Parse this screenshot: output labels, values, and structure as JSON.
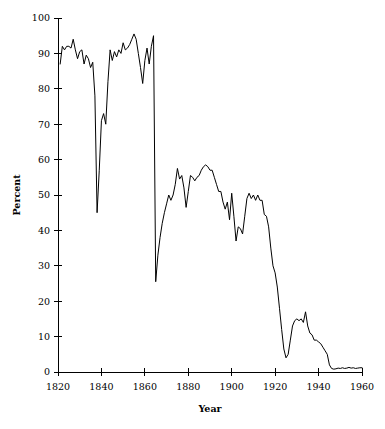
{
  "chart_data": {
    "type": "line",
    "title": "",
    "subtitle": "",
    "xlabel": "Year",
    "ylabel": "Percent",
    "xlim": [
      1820,
      1960
    ],
    "ylim": [
      0,
      100
    ],
    "xticks": [
      1820,
      1840,
      1860,
      1880,
      1900,
      1920,
      1940,
      1960
    ],
    "yticks": [
      0,
      10,
      20,
      30,
      40,
      50,
      60,
      70,
      80,
      90,
      100
    ],
    "xtick_labels": [
      "1820",
      "1840",
      "1860",
      "1880",
      "1900",
      "1920",
      "1940",
      "1960"
    ],
    "ytick_labels": [
      "0",
      "10",
      "20",
      "30",
      "40",
      "50",
      "60",
      "70",
      "80",
      "90",
      "100"
    ],
    "grid": false,
    "legend": false,
    "legend_position": "none",
    "line_color": "#000000",
    "background_color": "#ffffff",
    "series": [
      {
        "name": "Percent",
        "x": [
          1821,
          1822,
          1823,
          1824,
          1825,
          1826,
          1827,
          1828,
          1829,
          1830,
          1831,
          1832,
          1833,
          1834,
          1835,
          1836,
          1837,
          1838,
          1839,
          1840,
          1841,
          1842,
          1843,
          1844,
          1845,
          1846,
          1847,
          1848,
          1849,
          1850,
          1851,
          1852,
          1853,
          1854,
          1855,
          1856,
          1857,
          1858,
          1859,
          1860,
          1861,
          1862,
          1863,
          1864,
          1865,
          1866,
          1867,
          1868,
          1869,
          1870,
          1871,
          1872,
          1873,
          1874,
          1875,
          1876,
          1877,
          1878,
          1879,
          1880,
          1881,
          1882,
          1883,
          1884,
          1885,
          1886,
          1887,
          1888,
          1889,
          1890,
          1891,
          1892,
          1893,
          1894,
          1895,
          1896,
          1897,
          1898,
          1899,
          1900,
          1901,
          1902,
          1903,
          1904,
          1905,
          1906,
          1907,
          1908,
          1909,
          1910,
          1911,
          1912,
          1913,
          1914,
          1915,
          1916,
          1917,
          1918,
          1919,
          1920,
          1921,
          1922,
          1923,
          1924,
          1925,
          1926,
          1927,
          1928,
          1929,
          1930,
          1931,
          1932,
          1933,
          1934,
          1935,
          1936,
          1937,
          1938,
          1939,
          1940,
          1941,
          1942,
          1943,
          1944,
          1945,
          1946,
          1947,
          1948,
          1949,
          1950,
          1951,
          1952,
          1953,
          1954,
          1955,
          1956,
          1957,
          1958,
          1959,
          1960
        ],
        "values": [
          87,
          92,
          91,
          92,
          92,
          91.5,
          94,
          91,
          88.5,
          90.5,
          91,
          87,
          89.5,
          88.5,
          86,
          87.5,
          78,
          45,
          57,
          71,
          73,
          70,
          82,
          91,
          88,
          90.5,
          89,
          91,
          90,
          93,
          91,
          91.5,
          92.5,
          94,
          95.5,
          94,
          90,
          86,
          81.5,
          88,
          91.5,
          87,
          92,
          95,
          25.5,
          33,
          38,
          42,
          45,
          47.5,
          50,
          48.5,
          50,
          53,
          57.5,
          54.5,
          55.5,
          52,
          46.5,
          51,
          55.5,
          55,
          54,
          55,
          55.5,
          57,
          58,
          58.5,
          58,
          57,
          57,
          55,
          53,
          51,
          51,
          48,
          46,
          48,
          43,
          50.5,
          44,
          37,
          41,
          40.5,
          39,
          44,
          49,
          50.5,
          49,
          50,
          48.5,
          50,
          48.5,
          48.5,
          44.5,
          44,
          41,
          35,
          30,
          28,
          24,
          18,
          12,
          6.5,
          4,
          5,
          9,
          13,
          14.5,
          15,
          14.5,
          15,
          14,
          17,
          13,
          11,
          10.5,
          9,
          9,
          8.5,
          8,
          7,
          6,
          5,
          2,
          1,
          0.8,
          0.9,
          1.1,
          1,
          1.2,
          1,
          1.1,
          1.3,
          1.1,
          1.2,
          1,
          1.1,
          1.2,
          1.2
        ]
      }
    ]
  },
  "plot_geometry": {
    "left": 58,
    "top": 18,
    "right": 362,
    "bottom": 372
  }
}
